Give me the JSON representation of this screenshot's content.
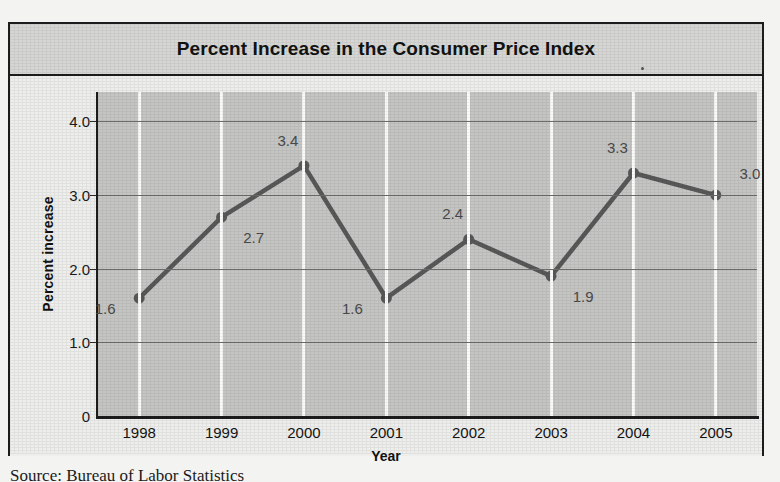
{
  "figure": {
    "title": "Percent Increase in the Consumer Price Index",
    "source_note": "Source: Bureau of Labor Statistics"
  },
  "colors": {
    "series_line": "#585858",
    "plot_background": "#c5c5c3",
    "title_band": "#d6d6d4",
    "frame": "#1c1c1c",
    "vertical_gridline": "#fbfbfa",
    "horizontal_gridline": "#6d6d6b",
    "label_text": "#4a4a4a"
  },
  "chart_data": {
    "type": "line",
    "title": "Percent Increase in the Consumer Price Index",
    "xlabel": "Year",
    "ylabel": "Percent increase",
    "categories": [
      "1998",
      "1999",
      "2000",
      "2001",
      "2002",
      "2003",
      "2004",
      "2005"
    ],
    "values": [
      1.6,
      2.7,
      3.4,
      1.6,
      2.4,
      1.9,
      3.3,
      3.0
    ],
    "point_labels": [
      "1.6",
      "2.7",
      "3.4",
      "1.6",
      "2.4",
      "1.9",
      "3.3",
      "3.0"
    ],
    "label_placement": [
      "left-below",
      "right-below",
      "above-left",
      "left-below",
      "above-left",
      "right-below",
      "above-left",
      "above-right"
    ],
    "ylim": [
      0,
      4.4
    ],
    "yticks": [
      0,
      1.0,
      2.0,
      3.0,
      4.0
    ],
    "ytick_labels": [
      "0",
      "1.0",
      "2.0",
      "3.0",
      "4.0"
    ],
    "xtick_labels": [
      "1998",
      "1999",
      "2000",
      "2001",
      "2002",
      "2003",
      "2004",
      "2005"
    ],
    "grid": "horizontal-and-vertical",
    "legend": "none",
    "markers": "filled-circle"
  }
}
